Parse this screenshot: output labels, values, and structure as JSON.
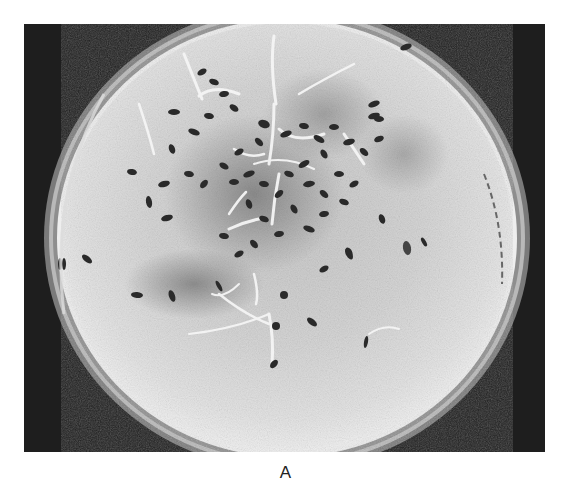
{
  "figure": {
    "caption": "A",
    "colors": {
      "background": "#1c1c1c",
      "dish_rim": "#8a8a8a",
      "paper": "#d9d9d9",
      "seed": "#2b2b2b",
      "radicle": "#f2f2f2"
    }
  }
}
